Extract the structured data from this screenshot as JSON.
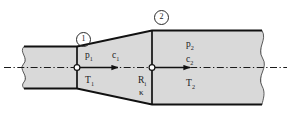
{
  "figure": {
    "colors": {
      "duct_fill": "#d9d9d9",
      "outline": "#111111",
      "axis_line": "#1a1a1a",
      "background": "#ffffff",
      "text": "#1b1b1b"
    },
    "stations": [
      {
        "id": "station-1",
        "marker": "1"
      },
      {
        "id": "station-2",
        "marker": "2"
      }
    ],
    "labels": {
      "p1_main": "p",
      "p1_sub": "1",
      "c1_main": "c",
      "c1_sub": "1",
      "T1_main": "T",
      "T1_sub": "1",
      "p2_main": "p",
      "p2_sub": "2",
      "c2_main": "c",
      "c2_sub": "2",
      "T2_main": "T",
      "T2_sub": "2",
      "R_main": "R",
      "R_sub": "i",
      "kappa": "κ"
    },
    "annotations": {
      "axis": "centerline (dash-dot)",
      "flow_arrow_1": "flow direction arrow at station 1",
      "flow_arrow_2": "flow direction arrow at station 2",
      "left_break": "wavy break line (left pipe end)",
      "right_break": "wavy break line (right pipe end)"
    }
  }
}
